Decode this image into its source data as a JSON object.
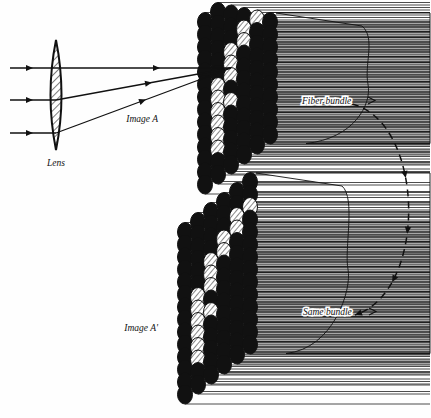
{
  "figure": {
    "type": "optical-diagram",
    "background_color": "#fefefe",
    "ink_color": "#111111"
  },
  "labels": {
    "lens": "Lens",
    "image_a": "Image A",
    "image_a_prime": "Image A'",
    "fiber_bundle": "Fiber bundle",
    "same_bundle": "Same bundle"
  },
  "lens": {
    "name": "biconvex-lens",
    "center_x": 56,
    "center_y": 95,
    "half_height": 55,
    "half_width": 11,
    "fill": "hatched",
    "hatch_angle_deg": 45
  },
  "rays": {
    "count": 3,
    "entry_y": [
      68,
      100,
      133
    ],
    "entry_x": 10,
    "converge_x": 231,
    "converge_y": 68,
    "arrowheads_before_lens_x": 33,
    "arrowheads_after_lens_x": [
      160,
      152,
      146
    ]
  },
  "bundles": [
    {
      "name": "upper-bundle",
      "label": "Fiber bundle",
      "label_x": 302,
      "label_y": 104,
      "image_label": "Image A",
      "image_label_x": 158,
      "image_label_y": 122,
      "origin_x": 205,
      "origin_y": 22,
      "rows": 14,
      "cols": 6,
      "ellipse_rx": 7.5,
      "ellipse_ry": 9.5,
      "col_dx": 13,
      "col_dy": -10,
      "row_dy": 12.5,
      "body_right_x": 430,
      "lit_pattern": [
        [
          2,
          4
        ],
        [
          2,
          5
        ],
        [
          3,
          3
        ],
        [
          3,
          4
        ],
        [
          4,
          2
        ],
        [
          4,
          3
        ],
        [
          5,
          2
        ],
        [
          6,
          1
        ],
        [
          6,
          2
        ],
        [
          7,
          1
        ],
        [
          8,
          1
        ],
        [
          8,
          2
        ],
        [
          9,
          1
        ],
        [
          10,
          1
        ],
        [
          11,
          1
        ]
      ]
    },
    {
      "name": "lower-bundle",
      "label": "Same bundle",
      "label_x": 303,
      "label_y": 315,
      "image_label": "Image A'",
      "image_label_x": 158,
      "image_label_y": 331,
      "origin_x": 185,
      "origin_y": 232,
      "rows": 14,
      "cols": 6,
      "ellipse_rx": 7.5,
      "ellipse_ry": 9.5,
      "col_dx": 13,
      "col_dy": -10,
      "row_dy": 12.5,
      "body_right_x": 430,
      "lit_pattern": [
        [
          2,
          4
        ],
        [
          2,
          5
        ],
        [
          3,
          3
        ],
        [
          3,
          4
        ],
        [
          4,
          2
        ],
        [
          4,
          3
        ],
        [
          5,
          2
        ],
        [
          6,
          1
        ],
        [
          6,
          2
        ],
        [
          7,
          1
        ],
        [
          8,
          1
        ],
        [
          8,
          2
        ],
        [
          9,
          1
        ],
        [
          10,
          1
        ],
        [
          11,
          1
        ]
      ]
    }
  ],
  "transfer_arc": {
    "name": "bundle-continuation-arc",
    "style": "dashed",
    "from_x": 352,
    "from_y": 104,
    "to_x": 355,
    "to_y": 315,
    "bulge_x": 425,
    "arrowheads": 3
  }
}
